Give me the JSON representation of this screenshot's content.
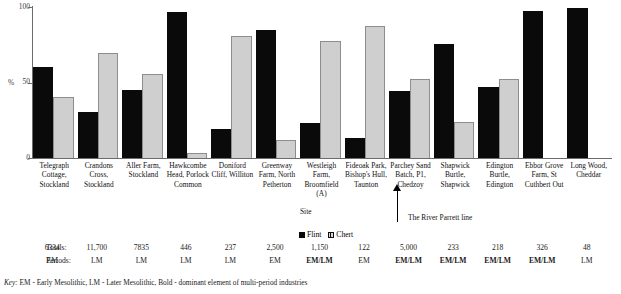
{
  "chart_data": {
    "type": "bar",
    "title": "",
    "xlabel": "Site",
    "ylabel": "%",
    "ylim": [
      0,
      100
    ],
    "yticks": [
      0,
      50,
      100
    ],
    "ytick_labels": [
      "0",
      "50",
      "100"
    ],
    "grid": false,
    "legend_position": "bottom-center",
    "categories": [
      "Telegraph Cottage, Stockland",
      "Crandons Cross, Stockland",
      "Aller Farm, Stockland",
      "Hawkcombe Head, Porlock Common",
      "Doniford Cliff, Williton",
      "Greenway Farm, North Petherton",
      "Westleigh Farm, Broomfield (A)",
      "Fideoak Park, Bishop's Hull, Taunton",
      "Parchey Sand Batch, P1, Chedzoy",
      "Shapwick Burtle, Shapwick",
      "Edington Burtle, Edington",
      "Ebbor Grove Farm, St Cuthbert Out",
      "Long Wood, Cheddar"
    ],
    "series": [
      {
        "name": "Flint",
        "color": "#0a0a0a",
        "values": [
          60,
          30,
          45,
          96,
          19,
          84,
          23,
          13,
          44,
          75,
          47,
          97,
          99
        ]
      },
      {
        "name": "Chert",
        "color": "#cfcfcf",
        "values": [
          40,
          69,
          55,
          3,
          80,
          12,
          77,
          87,
          52,
          24,
          52,
          0,
          0
        ]
      }
    ],
    "annotations": [
      {
        "text": "The River Parrett line",
        "attach_to_category_index": 8
      }
    ],
    "totals": [
      "6334",
      "11,700",
      "7835",
      "446",
      "237",
      "2,500",
      "1,150",
      "122",
      "5,000",
      "233",
      "218",
      "326",
      "48"
    ],
    "periods": [
      "EM",
      "LM",
      "LM",
      "LM",
      "LM",
      "EM",
      "EM/LM",
      "EM",
      "EM/LM",
      "EM/LM",
      "EM/LM",
      "EM/LM",
      "LM"
    ],
    "periods_bold": [
      false,
      false,
      false,
      false,
      false,
      false,
      true,
      false,
      true,
      true,
      true,
      true,
      false
    ]
  },
  "axis": {
    "y_label": "%",
    "y_ticks": [
      "100",
      "50",
      "0"
    ],
    "x_axis_title": "Site"
  },
  "legend": {
    "flint_label": "Flint",
    "chert_label": "Chert"
  },
  "categories_multiline": [
    [
      "Telegraph",
      "Cottage,",
      "Stockland"
    ],
    [
      "Crandons",
      "Cross,",
      "Stockland"
    ],
    [
      "Aller Farm,",
      "Stockland"
    ],
    [
      "Hawkcombe",
      "Head, Porlock",
      "Common"
    ],
    [
      "Doniford",
      "Cliff, Williton"
    ],
    [
      "Greenway",
      "Farm, North",
      "Petherton"
    ],
    [
      "Westleigh",
      "Farm,",
      "Broomfield",
      "(A)"
    ],
    [
      "Fideoak Park,",
      "Bishop's Hull,",
      "Taunton"
    ],
    [
      "Parchey Sand",
      "Batch, P1,",
      "Chedzoy"
    ],
    [
      "Shapwick",
      "Burtle,",
      "Shapwick"
    ],
    [
      "Edington",
      "Burtle,",
      "Edington"
    ],
    [
      "Ebbor Grove",
      "Farm, St",
      "Cuthbert Out"
    ],
    [
      "Long Wood,",
      "Cheddar"
    ]
  ],
  "annotation": {
    "river_line": "The River Parrett line"
  },
  "table": {
    "totals_label": "Totals:",
    "periods_label": "Periods:"
  },
  "key": {
    "prefix": "Key:",
    "text": "EM - Early Mesolithic, LM - Later Mesolithic, Bold - dominant element of multi-period industries"
  }
}
